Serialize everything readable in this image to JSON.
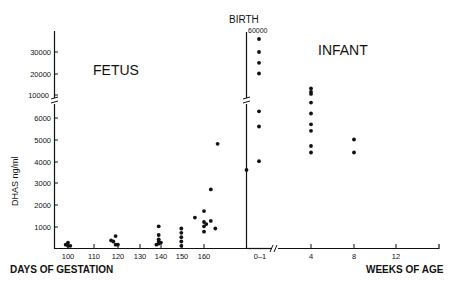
{
  "chart_data": {
    "type": "scatter",
    "title": "",
    "ylabel": "DHAS ng/ml",
    "xlabel_left": "DAYS OF GESTATION",
    "xlabel_right": "WEEKS OF AGE",
    "annotations": [
      "FETUS",
      "INFANT",
      "BIRTH",
      "60000"
    ],
    "y_ticks_lower": [
      1000,
      2000,
      3000,
      4000,
      5000,
      6000
    ],
    "y_ticks_upper": [
      10000,
      20000,
      30000
    ],
    "y_axis_break": "between 6000 and 10000",
    "x_ticks_fetus": [
      100,
      110,
      120,
      130,
      140,
      150,
      160
    ],
    "x_ticks_infant": [
      "0-1",
      "4",
      "8",
      "12"
    ],
    "x_axis_break": "between 0-1 and 4 weeks",
    "grid": false,
    "legend": null,
    "series": [
      {
        "name": "Fetus",
        "points": [
          {
            "x": 99,
            "y": 150
          },
          {
            "x": 100,
            "y": 100
          },
          {
            "x": 100,
            "y": 250
          },
          {
            "x": 101,
            "y": 100
          },
          {
            "x": 119,
            "y": 350
          },
          {
            "x": 120,
            "y": 300
          },
          {
            "x": 121,
            "y": 550
          },
          {
            "x": 121,
            "y": 150
          },
          {
            "x": 122,
            "y": 150
          },
          {
            "x": 140,
            "y": 1000
          },
          {
            "x": 140,
            "y": 600
          },
          {
            "x": 140,
            "y": 400
          },
          {
            "x": 140,
            "y": 300
          },
          {
            "x": 140,
            "y": 200
          },
          {
            "x": 141,
            "y": 250
          },
          {
            "x": 139,
            "y": 150
          },
          {
            "x": 150,
            "y": 900
          },
          {
            "x": 150,
            "y": 700
          },
          {
            "x": 150,
            "y": 500
          },
          {
            "x": 150,
            "y": 300
          },
          {
            "x": 150,
            "y": 100
          },
          {
            "x": 156,
            "y": 1400
          },
          {
            "x": 160,
            "y": 1700
          },
          {
            "x": 160,
            "y": 1200
          },
          {
            "x": 160,
            "y": 1000
          },
          {
            "x": 161,
            "y": 1100
          },
          {
            "x": 160,
            "y": 750
          },
          {
            "x": 163,
            "y": 2700
          },
          {
            "x": 163,
            "y": 1250
          },
          {
            "x": 165,
            "y": 900
          },
          {
            "x": 166,
            "y": 4800
          }
        ]
      },
      {
        "name": "Infant",
        "points": [
          {
            "x": "birth",
            "y": 3600
          },
          {
            "x": "0-1",
            "y": 60000
          },
          {
            "x": "0-1",
            "y": 30000
          },
          {
            "x": "0-1",
            "y": 25000
          },
          {
            "x": "0-1",
            "y": 20000
          },
          {
            "x": "0-1",
            "y": 6300
          },
          {
            "x": "0-1",
            "y": 5600
          },
          {
            "x": "0-1",
            "y": 4000
          },
          {
            "x": "4",
            "y": 13000
          },
          {
            "x": "4",
            "y": 11500
          },
          {
            "x": "4",
            "y": 10500
          },
          {
            "x": "4",
            "y": 6700
          },
          {
            "x": "4",
            "y": 6200
          },
          {
            "x": "4",
            "y": 5700
          },
          {
            "x": "4",
            "y": 5400
          },
          {
            "x": "4",
            "y": 4700
          },
          {
            "x": "4",
            "y": 4400
          },
          {
            "x": "8",
            "y": 5000
          },
          {
            "x": "8",
            "y": 4400
          }
        ]
      }
    ]
  },
  "labels": {
    "fetus": "FETUS",
    "infant": "INFANT",
    "birth": "BIRTH",
    "birth_value": "60000",
    "ylabel": "DHAS ng/ml",
    "xlabel_left": "DAYS OF GESTATION",
    "xlabel_right": "WEEKS OF AGE",
    "yt_30000": "30000",
    "yt_20000": "20000",
    "yt_10000": "10000",
    "yt_6000": "6000",
    "yt_5000": "5000",
    "yt_4000": "4000",
    "yt_3000": "3000",
    "yt_2000": "2000",
    "yt_1000": "1000",
    "xt_100": "100",
    "xt_110": "110",
    "xt_120": "120",
    "xt_130": "130",
    "xt_140": "140",
    "xt_150": "150",
    "xt_160": "160",
    "xt_01": "0–1",
    "xt_4": "4",
    "xt_8": "8",
    "xt_12": "12"
  }
}
